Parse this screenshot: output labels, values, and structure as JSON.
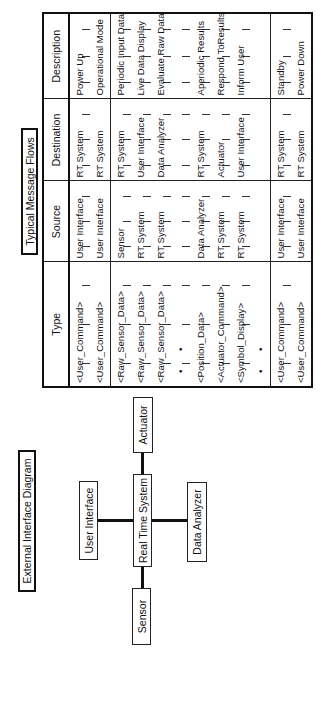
{
  "diagram": {
    "title": "External Interface Diagram",
    "nodes": {
      "center": "Real Time System",
      "top": "User Interface",
      "bottom": "Data Analyzer",
      "left": "Sensor",
      "right": "Actuator"
    }
  },
  "table": {
    "title": "Typical Message Flows",
    "headers": [
      "Type",
      "Source",
      "Destination",
      "Description"
    ],
    "rows": [
      {
        "type": "<User_Command>",
        "source": "User Interface",
        "destination": "RT System",
        "description": "Power Up"
      },
      {
        "type": "<User_Command>",
        "source": "User Interface",
        "destination": "RT System",
        "description": "Operational Mode"
      },
      {
        "type": "<Raw_Sensor_Data>",
        "source": "Sensor",
        "destination": "RT System",
        "description": "Periodic Input Data"
      },
      {
        "type": "<Raw_Sensor_Data>",
        "source": "RT System",
        "destination": "User Interface",
        "description": "Live Data Display"
      },
      {
        "type": "<Raw_Sensor_Data>",
        "source": "RT System",
        "destination": "Data Analyzer",
        "description": "Evaluate Raw Data"
      },
      {
        "type": "• •",
        "source": "",
        "destination": "",
        "description": ""
      },
      {
        "type": "<Position_Data>",
        "source": "Data Analyzer",
        "destination": "RT System",
        "description": "Aperiodic Results"
      },
      {
        "type": "<Actuator_Command>",
        "source": "RT System",
        "destination": "Actuator",
        "description": "Respond ToResults"
      },
      {
        "type": "<Symbol_Display>",
        "source": "RT System",
        "destination": "User Interface",
        "description": "Inform User"
      },
      {
        "type": "• •",
        "source": "",
        "destination": "",
        "description": ""
      },
      {
        "type": "<User_Command>",
        "source": "User Interface",
        "destination": "RT System",
        "description": "Standby"
      },
      {
        "type": "<User_Command>",
        "source": "User Interface",
        "destination": "RT System",
        "description": "Power Down"
      }
    ]
  }
}
